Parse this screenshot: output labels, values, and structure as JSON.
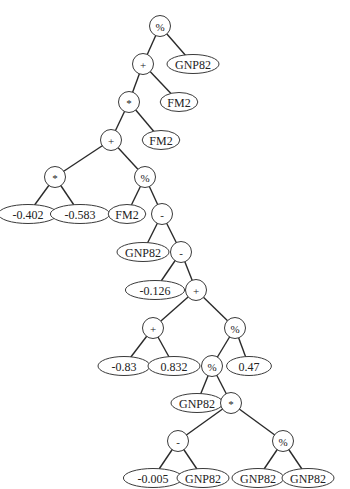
{
  "diagram": {
    "type": "expression-tree",
    "colors": {
      "background": "#ffffff",
      "stroke": "#3a3a3a",
      "text": "#222222"
    },
    "nodes": [
      {
        "id": "n0",
        "label": "%",
        "kind": "op",
        "x": 160,
        "y": 26
      },
      {
        "id": "n1",
        "label": "+",
        "kind": "op",
        "x": 143,
        "y": 64
      },
      {
        "id": "n2",
        "label": "GNP82",
        "kind": "leaf",
        "x": 193,
        "y": 64
      },
      {
        "id": "n3",
        "label": "*",
        "kind": "op",
        "x": 129,
        "y": 102
      },
      {
        "id": "n4",
        "label": "FM2",
        "kind": "leaf",
        "x": 179,
        "y": 102
      },
      {
        "id": "n5",
        "label": "+",
        "kind": "op",
        "x": 111,
        "y": 140
      },
      {
        "id": "n6",
        "label": "FM2",
        "kind": "leaf",
        "x": 161,
        "y": 140
      },
      {
        "id": "n7",
        "label": "*",
        "kind": "op",
        "x": 55,
        "y": 177
      },
      {
        "id": "n8",
        "label": "%",
        "kind": "op",
        "x": 145,
        "y": 177
      },
      {
        "id": "n9",
        "label": "-0.402",
        "kind": "leaf",
        "x": 28,
        "y": 214
      },
      {
        "id": "n10",
        "label": "-0.583",
        "kind": "leaf",
        "x": 80,
        "y": 214
      },
      {
        "id": "n11",
        "label": "FM2",
        "kind": "leaf",
        "x": 127,
        "y": 214
      },
      {
        "id": "n12",
        "label": "-",
        "kind": "op",
        "x": 162,
        "y": 214
      },
      {
        "id": "n13",
        "label": "GNP82",
        "kind": "leaf",
        "x": 143,
        "y": 252
      },
      {
        "id": "n14",
        "label": "-",
        "kind": "op",
        "x": 181,
        "y": 252
      },
      {
        "id": "n15",
        "label": "-0.126",
        "kind": "leaf",
        "x": 155,
        "y": 290
      },
      {
        "id": "n16",
        "label": "+",
        "kind": "op",
        "x": 196,
        "y": 290
      },
      {
        "id": "n17",
        "label": "+",
        "kind": "op",
        "x": 153,
        "y": 328
      },
      {
        "id": "n18",
        "label": "%",
        "kind": "op",
        "x": 235,
        "y": 328
      },
      {
        "id": "n19",
        "label": "-0.83",
        "kind": "leaf",
        "x": 124,
        "y": 366
      },
      {
        "id": "n20",
        "label": "0.832",
        "kind": "leaf",
        "x": 174,
        "y": 366
      },
      {
        "id": "n21",
        "label": "%",
        "kind": "op",
        "x": 212,
        "y": 366
      },
      {
        "id": "n22",
        "label": "0.47",
        "kind": "leaf",
        "x": 249,
        "y": 366
      },
      {
        "id": "n23",
        "label": "GNP82",
        "kind": "leaf",
        "x": 197,
        "y": 403
      },
      {
        "id": "n24",
        "label": "*",
        "kind": "op",
        "x": 231,
        "y": 403
      },
      {
        "id": "n25",
        "label": "-",
        "kind": "op",
        "x": 178,
        "y": 441
      },
      {
        "id": "n26",
        "label": "%",
        "kind": "op",
        "x": 283,
        "y": 441
      },
      {
        "id": "n27",
        "label": "-0.005",
        "kind": "leaf",
        "x": 153,
        "y": 478
      },
      {
        "id": "n28",
        "label": "GNP82",
        "kind": "leaf",
        "x": 203,
        "y": 478
      },
      {
        "id": "n29",
        "label": "GNP82",
        "kind": "leaf",
        "x": 258,
        "y": 478
      },
      {
        "id": "n30",
        "label": "GNP82",
        "kind": "leaf",
        "x": 308,
        "y": 478
      }
    ],
    "edges": [
      [
        "n0",
        "n1"
      ],
      [
        "n0",
        "n2"
      ],
      [
        "n1",
        "n3"
      ],
      [
        "n1",
        "n4"
      ],
      [
        "n3",
        "n5"
      ],
      [
        "n3",
        "n6"
      ],
      [
        "n5",
        "n7"
      ],
      [
        "n5",
        "n8"
      ],
      [
        "n7",
        "n9"
      ],
      [
        "n7",
        "n10"
      ],
      [
        "n8",
        "n11"
      ],
      [
        "n8",
        "n12"
      ],
      [
        "n12",
        "n13"
      ],
      [
        "n12",
        "n14"
      ],
      [
        "n14",
        "n15"
      ],
      [
        "n14",
        "n16"
      ],
      [
        "n16",
        "n17"
      ],
      [
        "n16",
        "n18"
      ],
      [
        "n17",
        "n19"
      ],
      [
        "n17",
        "n20"
      ],
      [
        "n18",
        "n21"
      ],
      [
        "n18",
        "n22"
      ],
      [
        "n21",
        "n23"
      ],
      [
        "n21",
        "n24"
      ],
      [
        "n24",
        "n25"
      ],
      [
        "n24",
        "n26"
      ],
      [
        "n25",
        "n27"
      ],
      [
        "n25",
        "n28"
      ],
      [
        "n26",
        "n29"
      ],
      [
        "n26",
        "n30"
      ]
    ]
  }
}
